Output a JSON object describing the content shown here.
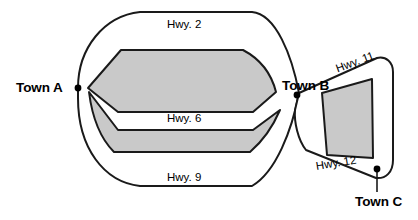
{
  "figure": {
    "kind": "road-network-map",
    "background_color": "#ffffff",
    "stroke_color": "#1a1a1a",
    "region_fill_color": "#c9c9c9",
    "dot_color": "#000000"
  },
  "towns": [
    {
      "id": "a",
      "label": "Town A",
      "dot_x": 78,
      "dot_y": 88
    },
    {
      "id": "b",
      "label": "Town B",
      "dot_x": 297,
      "dot_y": 95
    },
    {
      "id": "c",
      "label": "Town C",
      "dot_x": 377,
      "dot_y": 169
    }
  ],
  "highways": [
    {
      "id": "hwy2",
      "label": "Hwy. 2",
      "connects": [
        "Town A",
        "Town B"
      ]
    },
    {
      "id": "hwy6",
      "label": "Hwy. 6",
      "connects": [
        "Town A",
        "Town B"
      ]
    },
    {
      "id": "hwy9",
      "label": "Hwy. 9",
      "connects": [
        "Town A",
        "Town B"
      ]
    },
    {
      "id": "hwy11",
      "label": "Hwy. 11",
      "connects": [
        "Town B",
        "Town C"
      ]
    },
    {
      "id": "hwy12",
      "label": "Hwy. 12",
      "connects": [
        "Town B",
        "Town C"
      ]
    }
  ]
}
